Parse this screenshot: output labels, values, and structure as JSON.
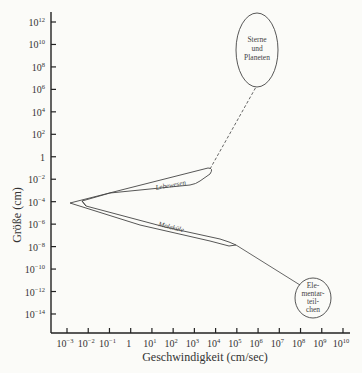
{
  "chart_data": {
    "type": "diagram",
    "title": "",
    "xlabel": "Geschwindigkeit (cm/sec)",
    "ylabel": "Größe (cm)",
    "x_scale": "log",
    "y_scale": "log",
    "x_ticks": [
      "10⁻³",
      "10⁻²",
      "10⁻¹",
      "1",
      "10¹",
      "10²",
      "10³",
      "10⁴",
      "10⁵",
      "10⁶",
      "10⁷",
      "10⁸",
      "10⁹",
      "10¹⁰"
    ],
    "y_ticks": [
      "10¹²",
      "10¹⁰",
      "10⁸",
      "10⁶",
      "10⁴",
      "10²",
      "1",
      "10⁻²",
      "10⁻⁴",
      "10⁻⁶",
      "10⁻⁸",
      "10⁻¹⁰",
      "10⁻¹²",
      "10⁻¹⁴"
    ],
    "regions": [
      {
        "name": "Lebewesen",
        "shape": "elongated wedge",
        "x_range_log10": [
          -3,
          3.5
        ],
        "y_range_log10": [
          -4,
          -1.5
        ]
      },
      {
        "name": "Moleküle",
        "shape": "elongated wedge",
        "x_range_log10": [
          -3,
          4.8
        ],
        "y_range_log10": [
          -7,
          -4
        ]
      },
      {
        "name": "Sterne und Planeten",
        "shape": "ellipse",
        "center_log10": [
          6,
          8.5
        ],
        "connector": "dashed line from Lebewesen tip"
      },
      {
        "name": "Elementarteilchen",
        "shape": "circle",
        "center_log10": [
          8.6,
          -12.5
        ],
        "connector": "solid line from Moleküle tip"
      }
    ]
  },
  "labels": {
    "xlabel": "Geschwindigkeit (cm/sec)",
    "ylabel": "Größe (cm)",
    "lebewesen": "Lebewesen",
    "molekule": "Moleküle",
    "sterne": [
      "Sterne",
      "und",
      "Planeten"
    ],
    "elementar": [
      "Ele-",
      "mentar-",
      "teil-",
      "chen"
    ]
  },
  "x_ticks": [
    {
      "base": "10",
      "exp": "-3"
    },
    {
      "base": "10",
      "exp": "-2"
    },
    {
      "base": "10",
      "exp": "-1"
    },
    {
      "base": "1",
      "exp": ""
    },
    {
      "base": "10",
      "exp": "1"
    },
    {
      "base": "10",
      "exp": "2"
    },
    {
      "base": "10",
      "exp": "3"
    },
    {
      "base": "10",
      "exp": "4"
    },
    {
      "base": "10",
      "exp": "5"
    },
    {
      "base": "10",
      "exp": "6"
    },
    {
      "base": "10",
      "exp": "7"
    },
    {
      "base": "10",
      "exp": "8"
    },
    {
      "base": "10",
      "exp": "9"
    },
    {
      "base": "10",
      "exp": "10"
    }
  ],
  "y_ticks": [
    {
      "base": "10",
      "exp": "12"
    },
    {
      "base": "10",
      "exp": "10"
    },
    {
      "base": "10",
      "exp": "8"
    },
    {
      "base": "10",
      "exp": "6"
    },
    {
      "base": "10",
      "exp": "4"
    },
    {
      "base": "10",
      "exp": "2"
    },
    {
      "base": "1",
      "exp": ""
    },
    {
      "base": "10",
      "exp": "-2"
    },
    {
      "base": "10",
      "exp": "-4"
    },
    {
      "base": "10",
      "exp": "-6"
    },
    {
      "base": "10",
      "exp": "-8"
    },
    {
      "base": "10",
      "exp": "-10"
    },
    {
      "base": "10",
      "exp": "-12"
    },
    {
      "base": "10",
      "exp": "-14"
    }
  ]
}
